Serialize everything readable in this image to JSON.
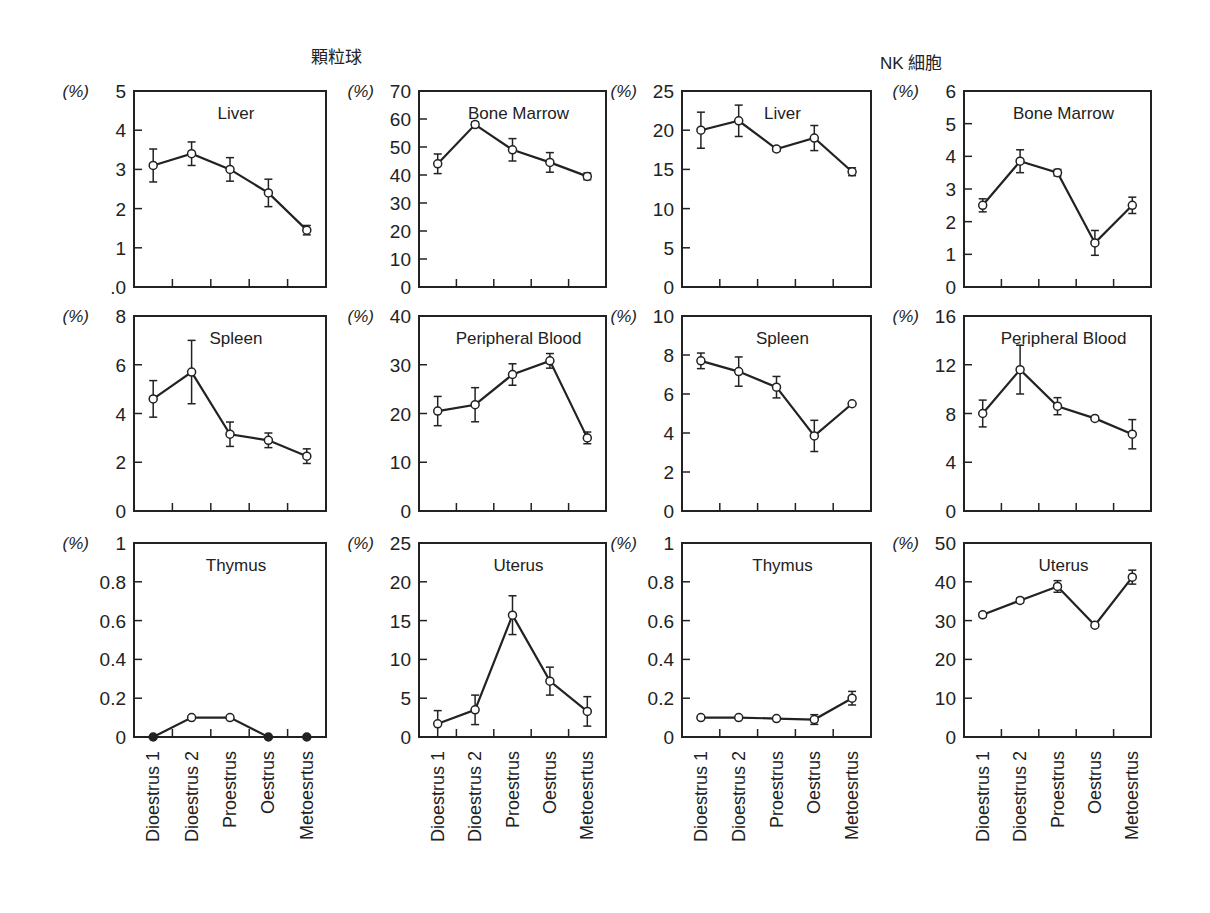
{
  "groups": {
    "left": {
      "title": "顆粒球"
    },
    "right": {
      "title": "NK 細胞"
    }
  },
  "chart_data": {
    "type": "line",
    "layout": "3x4 grid of small multiples with error bars",
    "categories": [
      "Dioestrus 1",
      "Dioestrus 2",
      "Proestrus",
      "Oestrus",
      "Metoesrtus"
    ],
    "y_unit_label": "(%)",
    "panels": [
      {
        "group": "顆粒球",
        "title": "Liver",
        "row": 0,
        "col": 0,
        "ylim": [
          0,
          5
        ],
        "yticks": [
          0,
          1,
          2,
          3,
          4,
          5
        ],
        "ytick_labels": [
          ".0",
          "1",
          "2",
          "3",
          "4",
          "5"
        ],
        "values": [
          3.1,
          3.4,
          3.0,
          2.4,
          1.45
        ],
        "errors": [
          0.42,
          0.3,
          0.3,
          0.35,
          0.12
        ],
        "markers": [
          "open",
          "open",
          "open",
          "open",
          "open"
        ]
      },
      {
        "group": "顆粒球",
        "title": "Bone Marrow",
        "row": 0,
        "col": 1,
        "ylim": [
          0,
          70
        ],
        "yticks": [
          0,
          10,
          20,
          30,
          40,
          50,
          60,
          70
        ],
        "ytick_labels": [
          "0",
          "10",
          "20",
          "30",
          "40",
          "50",
          "60",
          "70"
        ],
        "values": [
          44,
          58,
          49,
          44.5,
          39.5
        ],
        "errors": [
          3.5,
          1,
          4,
          3.5,
          1.2
        ],
        "markers": [
          "open",
          "open",
          "open",
          "open",
          "open"
        ]
      },
      {
        "group": "NK 細胞",
        "title": "Liver",
        "row": 0,
        "col": 2,
        "ylim": [
          0,
          25
        ],
        "yticks": [
          0,
          5,
          10,
          15,
          20,
          25
        ],
        "ytick_labels": [
          "0",
          "5",
          "10",
          "15",
          "20",
          "25"
        ],
        "values": [
          20,
          21.2,
          17.6,
          19,
          14.7
        ],
        "errors": [
          2.3,
          2,
          0.3,
          1.6,
          0.5
        ],
        "markers": [
          "open",
          "open",
          "open",
          "open",
          "open"
        ]
      },
      {
        "group": "NK 細胞",
        "title": "Bone Marrow",
        "row": 0,
        "col": 3,
        "ylim": [
          0,
          6
        ],
        "yticks": [
          0,
          1,
          2,
          3,
          4,
          5,
          6
        ],
        "ytick_labels": [
          "0",
          "1",
          "2",
          "3",
          "4",
          "5",
          "6"
        ],
        "values": [
          2.5,
          3.85,
          3.5,
          1.35,
          2.5
        ],
        "errors": [
          0.2,
          0.35,
          0.1,
          0.38,
          0.25
        ],
        "markers": [
          "open",
          "open",
          "open",
          "open",
          "open"
        ]
      },
      {
        "group": "顆粒球",
        "title": "Spleen",
        "row": 1,
        "col": 0,
        "ylim": [
          0,
          8
        ],
        "yticks": [
          0,
          2,
          4,
          6,
          8
        ],
        "ytick_labels": [
          "0",
          "2",
          "4",
          "6",
          "8"
        ],
        "values": [
          4.6,
          5.7,
          3.15,
          2.9,
          2.25
        ],
        "errors": [
          0.75,
          1.3,
          0.5,
          0.3,
          0.3
        ],
        "markers": [
          "open",
          "open",
          "open",
          "open",
          "open"
        ]
      },
      {
        "group": "顆粒球",
        "title": "Peripheral Blood",
        "row": 1,
        "col": 1,
        "ylim": [
          0,
          40
        ],
        "yticks": [
          0,
          10,
          20,
          30,
          40
        ],
        "ytick_labels": [
          "0",
          "10",
          "20",
          "30",
          "40"
        ],
        "values": [
          20.5,
          21.8,
          28,
          30.8,
          15
        ],
        "errors": [
          3,
          3.5,
          2.2,
          1.5,
          1.2
        ],
        "markers": [
          "open",
          "open",
          "open",
          "open",
          "open"
        ]
      },
      {
        "group": "NK 細胞",
        "title": "Spleen",
        "row": 1,
        "col": 2,
        "ylim": [
          0,
          10
        ],
        "yticks": [
          0,
          2,
          4,
          6,
          8,
          10
        ],
        "ytick_labels": [
          "0",
          "2",
          "4",
          "6",
          "8",
          "10"
        ],
        "values": [
          7.7,
          7.15,
          6.35,
          3.85,
          5.5
        ],
        "errors": [
          0.4,
          0.75,
          0.55,
          0.8,
          0.05
        ],
        "markers": [
          "open",
          "open",
          "open",
          "open",
          "open"
        ]
      },
      {
        "group": "NK 細胞",
        "title": "Peripheral Blood",
        "row": 1,
        "col": 3,
        "ylim": [
          0,
          16
        ],
        "yticks": [
          0,
          4,
          8,
          12,
          16
        ],
        "ytick_labels": [
          "0",
          "4",
          "8",
          "12",
          "16"
        ],
        "values": [
          8,
          11.6,
          8.6,
          7.6,
          6.3
        ],
        "errors": [
          1.1,
          2,
          0.7,
          0.15,
          1.2
        ],
        "markers": [
          "open",
          "open",
          "open",
          "open",
          "open"
        ]
      },
      {
        "group": "顆粒球",
        "title": "Thymus",
        "row": 2,
        "col": 0,
        "ylim": [
          0,
          1
        ],
        "yticks": [
          0,
          0.2,
          0.4,
          0.6,
          0.8,
          1
        ],
        "ytick_labels": [
          "0",
          "0.2",
          "0.4",
          "0.6",
          "0.8",
          "1"
        ],
        "values": [
          0,
          0.1,
          0.1,
          0,
          0
        ],
        "errors": [
          0,
          0,
          0,
          0,
          0
        ],
        "markers": [
          "filled",
          "open",
          "open",
          "filled",
          "filled"
        ]
      },
      {
        "group": "顆粒球",
        "title": "Uterus",
        "row": 2,
        "col": 1,
        "ylim": [
          0,
          25
        ],
        "yticks": [
          0,
          5,
          10,
          15,
          20,
          25
        ],
        "ytick_labels": [
          "0",
          "5",
          "10",
          "15",
          "20",
          "25"
        ],
        "values": [
          1.7,
          3.5,
          15.7,
          7.2,
          3.3
        ],
        "errors": [
          1.7,
          1.9,
          2.5,
          1.8,
          1.9
        ],
        "markers": [
          "open",
          "open",
          "open",
          "open",
          "open"
        ]
      },
      {
        "group": "NK 細胞",
        "title": "Thymus",
        "row": 2,
        "col": 2,
        "ylim": [
          0,
          1
        ],
        "yticks": [
          0,
          0.2,
          0.4,
          0.6,
          0.8,
          1
        ],
        "ytick_labels": [
          "0",
          "0.2",
          "0.4",
          "0.6",
          "0.8",
          "1"
        ],
        "values": [
          0.1,
          0.1,
          0.095,
          0.09,
          0.2
        ],
        "errors": [
          0.005,
          0.005,
          0.005,
          0.025,
          0.035
        ],
        "markers": [
          "open",
          "open",
          "open",
          "open",
          "open"
        ]
      },
      {
        "group": "NK 細胞",
        "title": "Uterus",
        "row": 2,
        "col": 3,
        "ylim": [
          0,
          50
        ],
        "yticks": [
          0,
          10,
          20,
          30,
          40,
          50
        ],
        "ytick_labels": [
          "0",
          "10",
          "20",
          "30",
          "40",
          "50"
        ],
        "values": [
          31.5,
          35.2,
          38.8,
          28.8,
          41.2
        ],
        "errors": [
          0.5,
          0.6,
          1.5,
          0.5,
          1.8
        ],
        "markers": [
          "open",
          "open",
          "open",
          "open",
          "open"
        ]
      }
    ]
  },
  "layout_px": {
    "col_x": [
      [
        134,
        326
      ],
      [
        419,
        606
      ],
      [
        682,
        871
      ],
      [
        964,
        1151
      ]
    ],
    "row_y": [
      [
        91,
        287
      ],
      [
        316,
        511
      ],
      [
        543,
        737
      ]
    ]
  }
}
